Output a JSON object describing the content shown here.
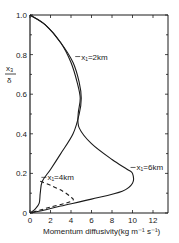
{
  "chart_data": {
    "type": "line",
    "title": "",
    "xlabel": "Momentum diffusivity(kg m⁻¹ s⁻¹)",
    "ylabel_top": "x₃",
    "ylabel_bottom": "δ",
    "xlim": [
      0,
      14
    ],
    "ylim": [
      0,
      1.0
    ],
    "x_ticks": [
      "0",
      "2",
      "4",
      "6",
      "8",
      "10",
      "12"
    ],
    "y_ticks": [
      "0",
      "0.2",
      "0.4",
      "0.6",
      "0.8",
      "1.0"
    ],
    "grid": false,
    "legend": "none (inline annotations)",
    "series": [
      {
        "name": "x₁=2km",
        "style": "solid",
        "points": [
          [
            0,
            1.0
          ],
          [
            1.5,
            0.95
          ],
          [
            3.0,
            0.86
          ],
          [
            4.2,
            0.76
          ],
          [
            4.8,
            0.66
          ],
          [
            5.0,
            0.58
          ],
          [
            4.8,
            0.5
          ],
          [
            4.2,
            0.4
          ],
          [
            3.0,
            0.3
          ],
          [
            2.0,
            0.22
          ],
          [
            1.2,
            0.16
          ],
          [
            1.0,
            0.1
          ],
          [
            0.9,
            0.05
          ],
          [
            0.5,
            0.02
          ],
          [
            0,
            0
          ]
        ]
      },
      {
        "name": "x₁=4km",
        "style": "dashed",
        "points": [
          [
            1.0,
            0.16
          ],
          [
            2.0,
            0.14
          ],
          [
            3.2,
            0.11
          ],
          [
            4.0,
            0.08
          ],
          [
            4.2,
            0.065
          ],
          [
            3.5,
            0.05
          ],
          [
            2.0,
            0.03
          ],
          [
            1.0,
            0.015
          ],
          [
            0,
            0
          ]
        ]
      },
      {
        "name": "x₁=6km",
        "style": "solid",
        "points": [
          [
            0,
            1.0
          ],
          [
            1.5,
            0.95
          ],
          [
            3.0,
            0.86
          ],
          [
            4.0,
            0.76
          ],
          [
            4.6,
            0.66
          ],
          [
            4.9,
            0.58
          ],
          [
            4.7,
            0.5
          ],
          [
            4.8,
            0.43
          ],
          [
            6.0,
            0.35
          ],
          [
            8.0,
            0.27
          ],
          [
            9.5,
            0.22
          ],
          [
            10.0,
            0.2
          ],
          [
            10.0,
            0.15
          ],
          [
            9.0,
            0.11
          ],
          [
            6.0,
            0.07
          ],
          [
            3.0,
            0.035
          ],
          [
            1.0,
            0.01
          ],
          [
            0,
            0
          ]
        ]
      }
    ],
    "annotations": [
      {
        "text": "x₁=2km",
        "x": 4.9,
        "y": 0.78
      },
      {
        "text": "x₁=4km",
        "x": 1.6,
        "y": 0.17
      },
      {
        "text": "x₁=6km",
        "x": 10.3,
        "y": 0.22
      }
    ]
  }
}
